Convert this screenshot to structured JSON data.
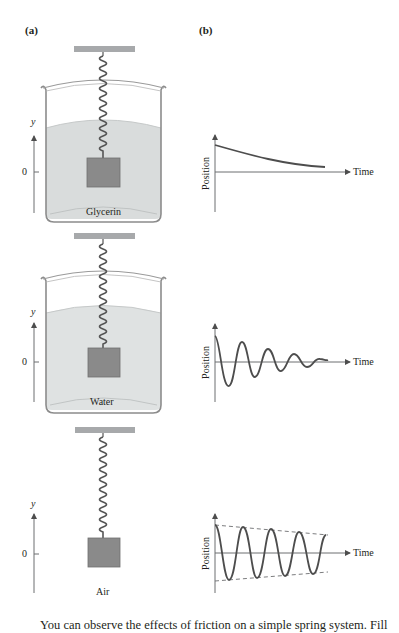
{
  "figure": {
    "panel_a_label": "(a)",
    "panel_b_label": "(b)",
    "systems": [
      {
        "medium": "Glycerin",
        "has_beaker": true,
        "axis_label": "y",
        "zero_label": "0",
        "graph": {
          "ylabel": "Position",
          "xlabel": "Time",
          "behavior": "overdamped: slow exponential decay toward equilibrium without oscillation"
        }
      },
      {
        "medium": "Water",
        "has_beaker": true,
        "axis_label": "y",
        "zero_label": "0",
        "graph": {
          "ylabel": "Position",
          "xlabel": "Time",
          "behavior": "underdamped: oscillation with rapidly decaying amplitude"
        }
      },
      {
        "medium": "Air",
        "has_beaker": false,
        "axis_label": "y",
        "zero_label": "0",
        "graph": {
          "ylabel": "Position",
          "xlabel": "Time",
          "behavior": "lightly damped: oscillation with slowly decaying amplitude within dashed envelope"
        }
      }
    ],
    "caption_fragment": "You can observe the effects of friction on a simple spring system. Fill"
  },
  "colors": {
    "mass": "#8a8a8a",
    "mass_border": "#6f6f6f",
    "liquid": "#d9dcdc",
    "beaker_outline": "#8c8c8c",
    "ceiling": "#a7a9ab",
    "curve": "#4d4d4d",
    "axis": "#6d6e70",
    "text": "#231f20"
  }
}
